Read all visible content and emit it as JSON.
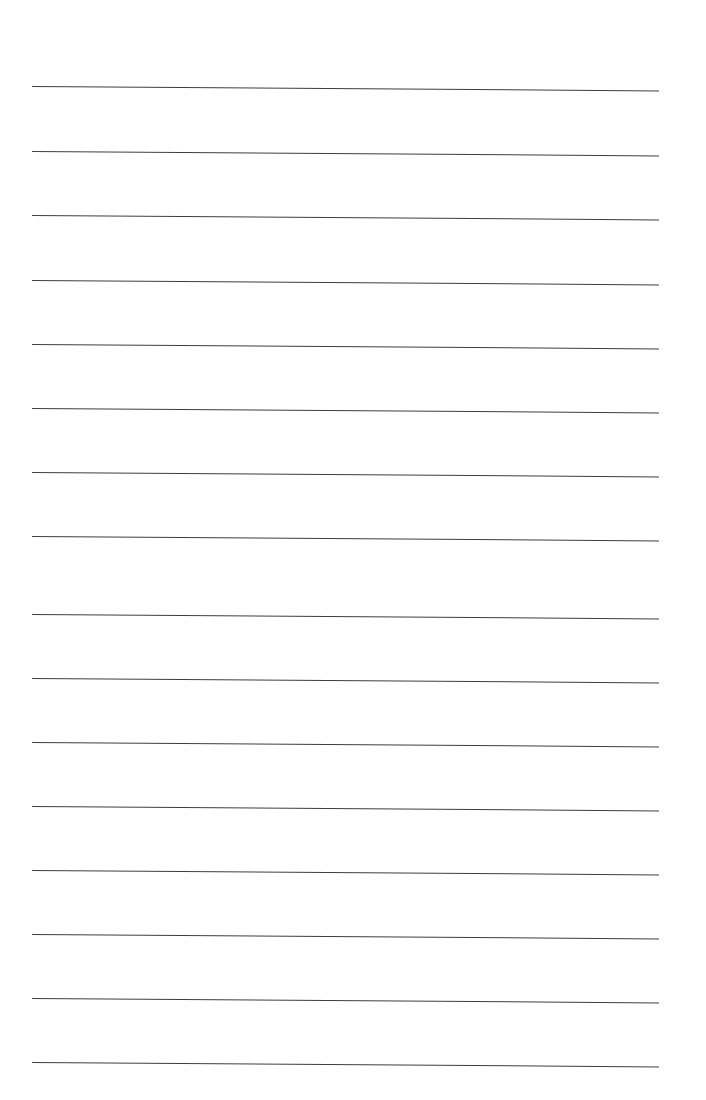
{
  "page": {
    "type": "ruled-notepaper",
    "background_color": "#ffffff",
    "line_color": "#3f3f3f",
    "line_left_x": 32,
    "line_right_x": 659,
    "line_slant_deg": 0.4,
    "ruled_lines": [
      {
        "y": 86
      },
      {
        "y": 151
      },
      {
        "y": 215
      },
      {
        "y": 280
      },
      {
        "y": 344
      },
      {
        "y": 408
      },
      {
        "y": 472
      },
      {
        "y": 536
      },
      {
        "y": 614
      },
      {
        "y": 678
      },
      {
        "y": 742
      },
      {
        "y": 806
      },
      {
        "y": 870
      },
      {
        "y": 934
      },
      {
        "y": 998
      },
      {
        "y": 1062
      }
    ]
  }
}
